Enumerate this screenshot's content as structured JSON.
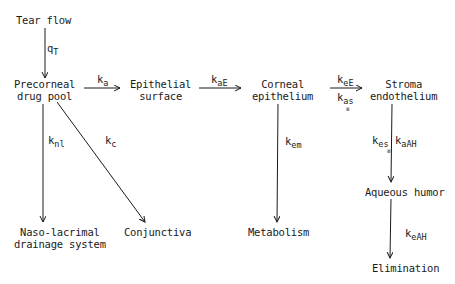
{
  "diagram": {
    "type": "pharmacokinetic-compartment-flow",
    "nodes": {
      "tear_flow": {
        "line1": "Tear flow"
      },
      "precorneal": {
        "line1": "Precorneal",
        "line2": "drug pool"
      },
      "epithelial_surface": {
        "line1": "Epithelial",
        "line2": "surface"
      },
      "corneal_epithelium": {
        "line1": "Corneal",
        "line2": "epithelium"
      },
      "stroma_endothelium": {
        "line1": "Stroma",
        "line2": "endothelium"
      },
      "nasolacrimal": {
        "line1": "Naso-lacrimal",
        "line2": "drainage system"
      },
      "conjunctiva": {
        "line1": "Conjunctiva"
      },
      "metabolism": {
        "line1": "Metabolism"
      },
      "aqueous_humor": {
        "line1": "Aqueous humor"
      },
      "elimination": {
        "line1": "Elimination"
      }
    },
    "edges": {
      "qT": {
        "base": "q",
        "sub": "T",
        "from": "Tear flow",
        "to": "Precorneal drug pool"
      },
      "ka": {
        "base": "k",
        "sub": "a",
        "from": "Precorneal drug pool",
        "to": "Epithelial surface"
      },
      "kaE": {
        "base": "k",
        "sub": "aE",
        "from": "Epithelial surface",
        "to": "Corneal epithelium"
      },
      "keE": {
        "base": "k",
        "sub": "eE",
        "from": "Corneal epithelium",
        "to": "Stroma endothelium"
      },
      "kas": {
        "base": "k",
        "sub": "as"
      },
      "knl": {
        "base": "k",
        "sub": "nl",
        "from": "Precorneal drug pool",
        "to": "Naso-lacrimal drainage system"
      },
      "kc": {
        "base": "k",
        "sub": "c",
        "from": "Precorneal drug pool",
        "to": "Conjunctiva"
      },
      "kem": {
        "base": "k",
        "sub": "em",
        "from": "Corneal epithelium",
        "to": "Metabolism"
      },
      "kes": {
        "base": "k",
        "sub": "es",
        "from": "Stroma endothelium",
        "to": "Aqueous humor"
      },
      "kaAH": {
        "base": "k",
        "sub": "aAH"
      },
      "keAH": {
        "base": "k",
        "sub": "eAH",
        "from": "Aqueous humor",
        "to": "Elimination"
      }
    },
    "colors": {
      "line": "#1a1a1a",
      "background": "#ffffff"
    }
  }
}
